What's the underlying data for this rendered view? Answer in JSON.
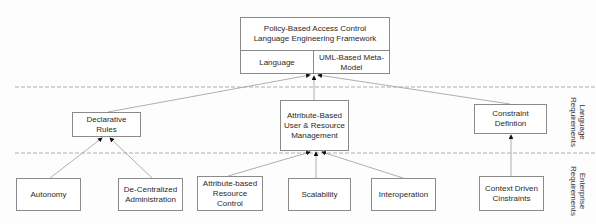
{
  "diagram": {
    "framework": {
      "title": "Policy-Based Access Control\nLanguage Engineering Framework",
      "left_cell": "Language",
      "right_cell": "UML-Based Meta-\nModel"
    },
    "layers": {
      "language": "Language\nRequirements",
      "enterprise": "Enterprise\nRequirements"
    },
    "language_requirements": [
      {
        "id": "declarative",
        "label": "Declarative Rules"
      },
      {
        "id": "abac",
        "label": "Attribute-Based\nUser & Resource\nManagement"
      },
      {
        "id": "constraint",
        "label": "Constraint\nDefintion"
      }
    ],
    "enterprise_requirements": [
      {
        "id": "autonomy",
        "label": "Autonomy",
        "parent": "declarative"
      },
      {
        "id": "decentral",
        "label": "De-Centralized\nAdministration",
        "parent": "declarative"
      },
      {
        "id": "attr_res",
        "label": "Attribute-based\nResource\nControl",
        "parent": "abac"
      },
      {
        "id": "scalability",
        "label": "Scalability",
        "parent": "abac"
      },
      {
        "id": "interop",
        "label": "Interoperation",
        "parent": "abac"
      },
      {
        "id": "context",
        "label": "Context Driven\nCinstraints",
        "parent": "constraint"
      }
    ],
    "colors": {
      "line": "#9a9a9a",
      "arrow": "#111111",
      "border": "#8a8a8a",
      "dash": "#9a9a9a"
    }
  }
}
